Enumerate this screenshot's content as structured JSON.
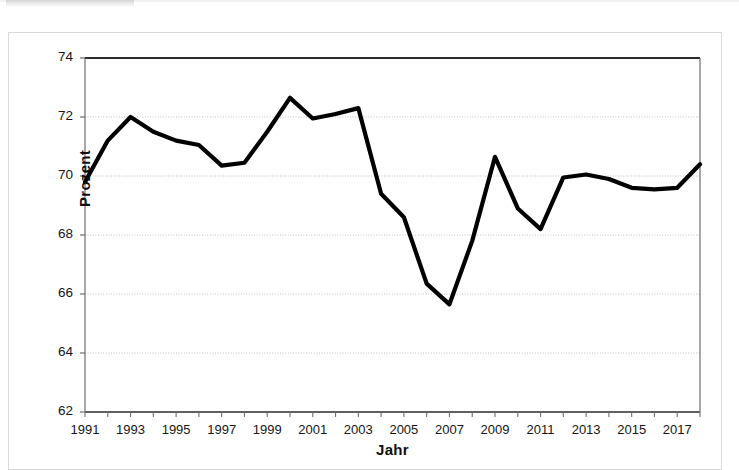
{
  "figure": {
    "background_color": "#ffffff",
    "frame_color": "#d9d9d9",
    "line_color": "#000000",
    "gridline_color": "#bfbfbf",
    "axis_color": "#404040"
  },
  "chart_data": {
    "type": "line",
    "title": "",
    "subtitle": "",
    "xlabel": "Jahr",
    "ylabel": "Prozent",
    "xlim": [
      1991,
      2018
    ],
    "ylim": [
      62,
      74
    ],
    "ytick_labels": [
      "62",
      "64",
      "66",
      "68",
      "70",
      "72",
      "74"
    ],
    "yticks": [
      62,
      64,
      66,
      68,
      70,
      72,
      74
    ],
    "xtick_labels": [
      "1991",
      "1993",
      "1995",
      "1997",
      "1999",
      "2001",
      "2003",
      "2005",
      "2007",
      "2009",
      "2011",
      "2013",
      "2015",
      "2017"
    ],
    "xticks": [
      1991,
      1993,
      1995,
      1997,
      1999,
      2001,
      2003,
      2005,
      2007,
      2009,
      2011,
      2013,
      2015,
      2017
    ],
    "grid": "horizontal",
    "legend": "none",
    "x": [
      1991,
      1992,
      1993,
      1994,
      1995,
      1996,
      1997,
      1998,
      1999,
      2000,
      2001,
      2002,
      2003,
      2004,
      2005,
      2006,
      2007,
      2008,
      2009,
      2010,
      2011,
      2012,
      2013,
      2014,
      2015,
      2016,
      2017,
      2018
    ],
    "series": [
      {
        "name": "Prozent",
        "values": [
          69.8,
          71.2,
          72.0,
          71.5,
          71.2,
          71.05,
          70.35,
          70.45,
          71.5,
          72.65,
          71.95,
          72.1,
          72.3,
          69.4,
          68.6,
          66.35,
          65.65,
          67.8,
          70.65,
          68.9,
          68.2,
          69.95,
          70.05,
          69.9,
          69.6,
          69.55,
          69.6,
          70.4
        ]
      }
    ],
    "annotations": []
  }
}
